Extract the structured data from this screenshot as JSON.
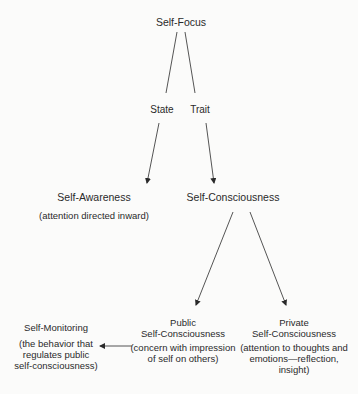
{
  "diagram": {
    "root": {
      "label": "Self-Focus"
    },
    "branches": {
      "state": {
        "label": "State"
      },
      "trait": {
        "label": "Trait"
      }
    },
    "self_awareness": {
      "label": "Self-Awareness",
      "description": "(attention directed inward)"
    },
    "self_consciousness": {
      "label": "Self-Consciousness"
    },
    "public": {
      "label_line1": "Public",
      "label_line2": "Self-Consciousness",
      "desc_line1": "(concern with impression",
      "desc_line2": "of self on others)"
    },
    "private": {
      "label_line1": "Private",
      "label_line2": "Self-Consciousness",
      "desc_line1": "(attention to thoughts and",
      "desc_line2": "emotions—reflection,",
      "desc_line3": "insight)"
    },
    "self_monitoring": {
      "label": "Self-Monitoring",
      "desc_line1": "(the behavior that",
      "desc_line2": "regulates public",
      "desc_line3": "self-consciousness)"
    },
    "edges": [
      {
        "from": "Self-Focus",
        "to": "State",
        "type": "line"
      },
      {
        "from": "Self-Focus",
        "to": "Trait",
        "type": "line"
      },
      {
        "from": "State",
        "to": "Self-Awareness",
        "type": "arrow"
      },
      {
        "from": "Trait",
        "to": "Self-Consciousness",
        "type": "arrow"
      },
      {
        "from": "Self-Consciousness",
        "to": "Public Self-Consciousness",
        "type": "arrow"
      },
      {
        "from": "Self-Consciousness",
        "to": "Private Self-Consciousness",
        "type": "arrow"
      },
      {
        "from": "Public Self-Consciousness",
        "to": "Self-Monitoring",
        "type": "arrow"
      }
    ],
    "colors": {
      "background": "#fbfbfa",
      "text": "#2a2a2a",
      "lines": "#2a2a2a"
    }
  }
}
